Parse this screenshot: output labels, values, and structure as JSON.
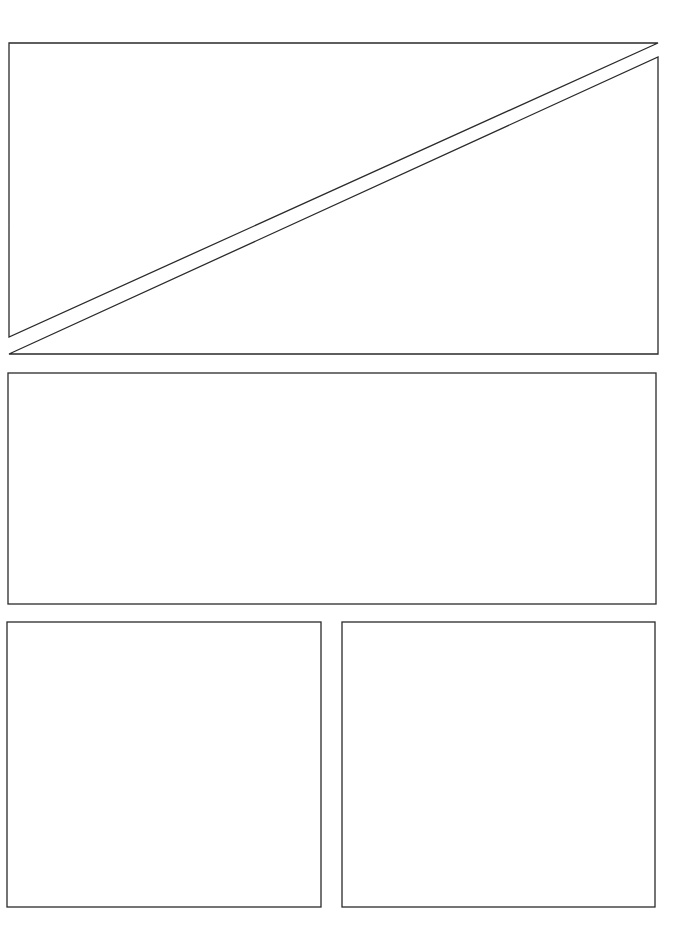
{
  "page": {
    "width": 686,
    "height": 944,
    "background": "#ffffff",
    "stroke_color": "#2a2a2a",
    "stroke_width": 1.3
  },
  "panels": [
    {
      "id": "top-triangle-upper",
      "shape": "polygon",
      "points": [
        [
          9,
          43
        ],
        [
          658,
          43
        ],
        [
          9,
          337
        ]
      ]
    },
    {
      "id": "top-triangle-lower",
      "shape": "polygon",
      "points": [
        [
          658,
          57
        ],
        [
          658,
          354
        ],
        [
          9,
          354
        ]
      ]
    },
    {
      "id": "middle-wide",
      "shape": "rect",
      "x": 8,
      "y": 373,
      "width": 648,
      "height": 231
    },
    {
      "id": "bottom-left",
      "shape": "rect",
      "x": 7,
      "y": 622,
      "width": 314,
      "height": 285
    },
    {
      "id": "bottom-right",
      "shape": "rect",
      "x": 342,
      "y": 622,
      "width": 313,
      "height": 285
    }
  ]
}
